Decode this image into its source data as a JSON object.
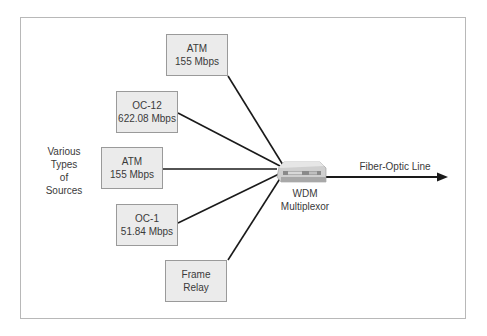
{
  "diagram": {
    "left_label": [
      "Various",
      "Types",
      "of",
      "Sources"
    ],
    "sources": [
      {
        "line1": "ATM",
        "line2": "155 Mbps"
      },
      {
        "line1": "OC-12",
        "line2": "622.08 Mbps"
      },
      {
        "line1": "ATM",
        "line2": "155 Mbps"
      },
      {
        "line1": "OC-1",
        "line2": "51.84 Mbps"
      },
      {
        "line1": "Frame",
        "line2": "Relay"
      }
    ],
    "device": {
      "line1": "WDM",
      "line2": "Multiplexor"
    },
    "output_label": "Fiber-Optic Line"
  }
}
